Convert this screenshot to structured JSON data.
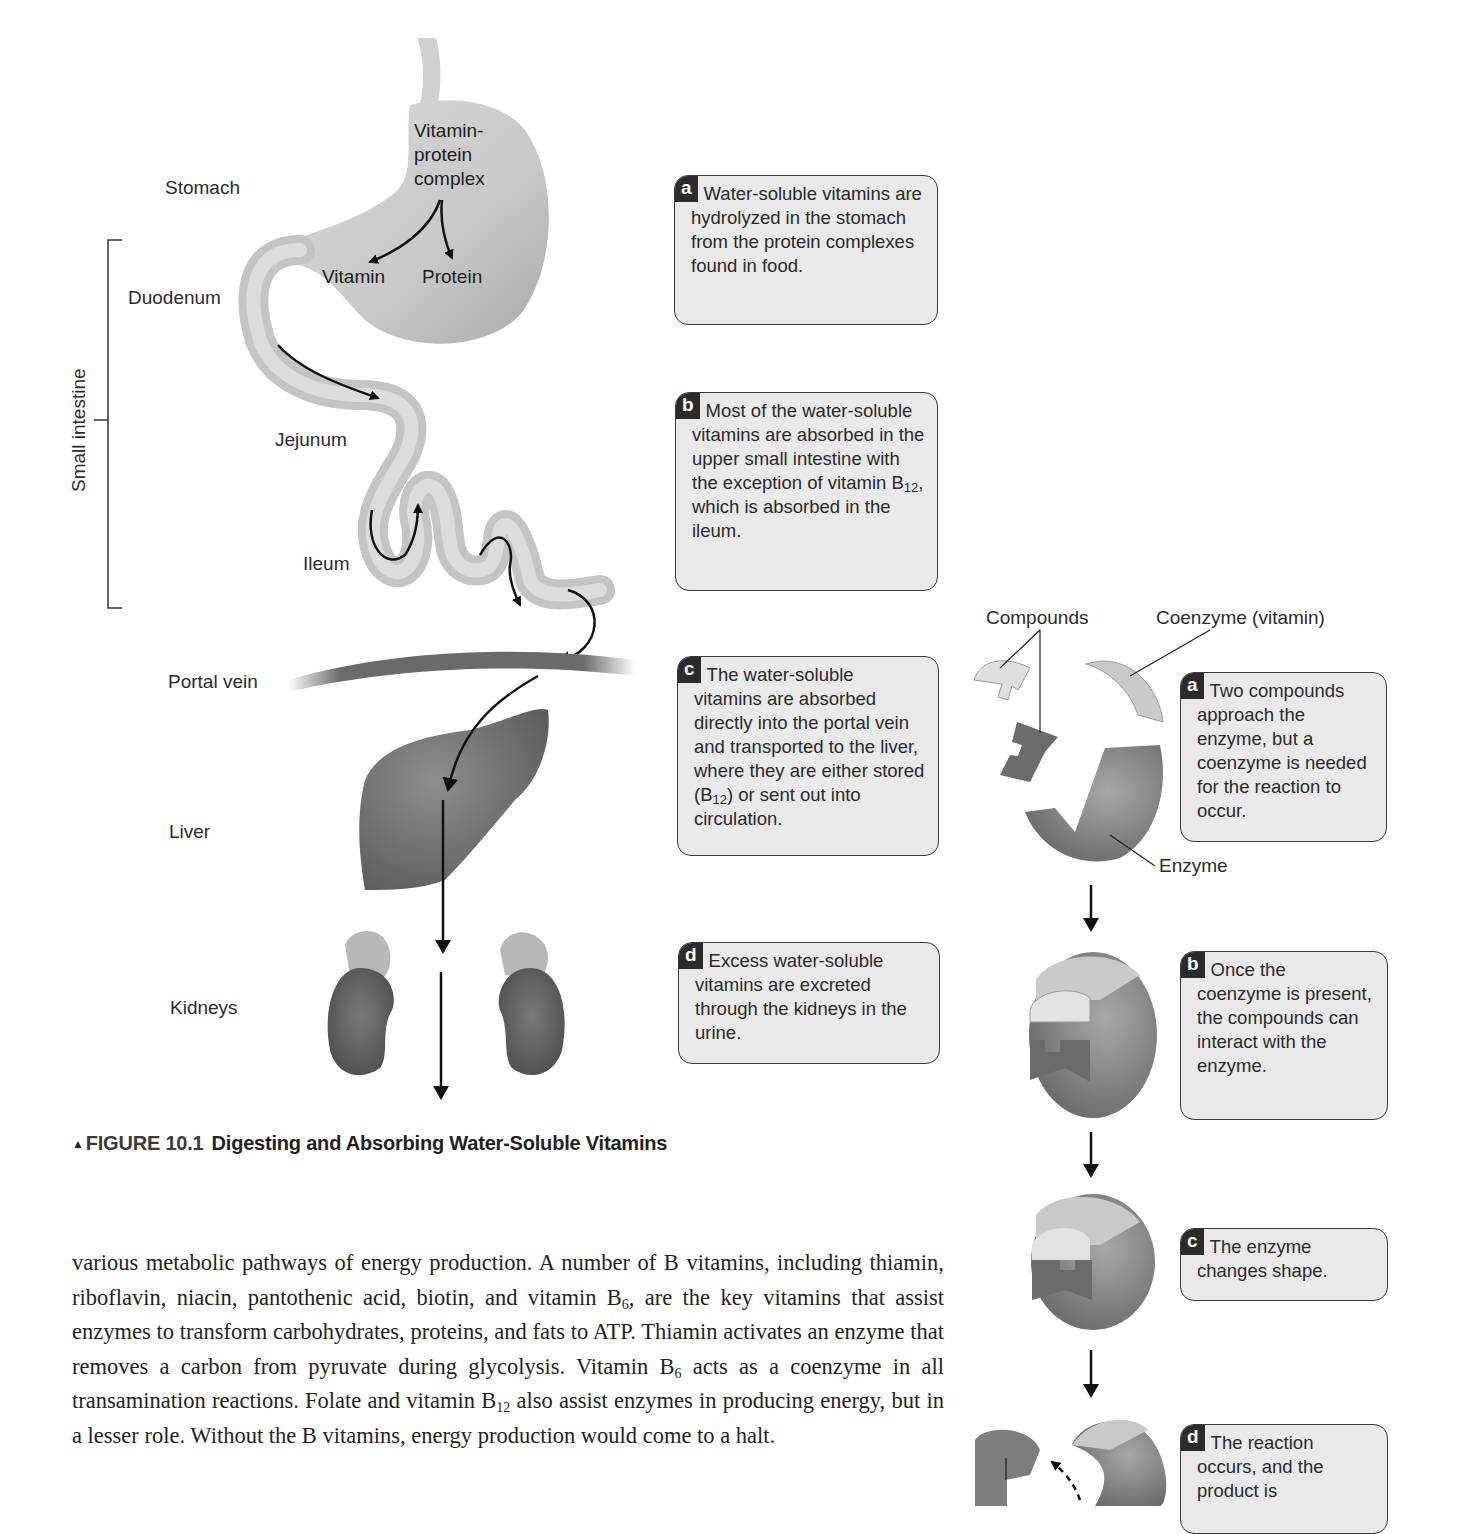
{
  "figure_left": {
    "organ_labels": {
      "stomach": "Stomach",
      "duodenum": "Duodenum",
      "small_intestine": "Small intestine",
      "jejunum": "Jejunum",
      "ileum": "Ileum",
      "portal_vein": "Portal vein",
      "liver": "Liver",
      "kidneys": "Kidneys"
    },
    "stomach_labels": {
      "complex_line1": "Vitamin-",
      "complex_line2": "protein",
      "complex_line3": "complex",
      "vitamin": "Vitamin",
      "protein": "Protein"
    },
    "callouts": [
      {
        "letter": "a",
        "text": "Water-soluble vitamins are hydrolyzed in the stomach from the protein complexes found in food."
      },
      {
        "letter": "b",
        "text_before": "Most of the water-soluble vitamins are absorbed in the upper small intestine with the exception of vitamin B",
        "sub": "12",
        "text_after": ", which is absorbed in the ileum."
      },
      {
        "letter": "c",
        "text_before": "The water-soluble vitamins are absorbed directly into the portal vein and transported to the liver, where they are either stored (B",
        "sub": "12",
        "text_after": ") or sent out into circulation."
      },
      {
        "letter": "d",
        "text": "Excess water-soluble vitamins are excreted through the kidneys in the urine."
      }
    ]
  },
  "figure_right": {
    "labels": {
      "compounds": "Compounds",
      "coenzyme": "Coenzyme (vitamin)",
      "enzyme": "Enzyme"
    },
    "callouts": [
      {
        "letter": "a",
        "text": "Two compounds approach the enzyme, but a coenzyme is needed for the reaction to occur."
      },
      {
        "letter": "b",
        "text": "Once the coenzyme is present, the compounds can interact with the enzyme."
      },
      {
        "letter": "c",
        "text": "The enzyme changes shape."
      },
      {
        "letter": "d",
        "text": "The reaction occurs, and the product is"
      }
    ]
  },
  "caption": {
    "marker": "▲",
    "figure_number": "FIGURE 10.1",
    "title": "Digesting and Absorbing Water-Soluble Vitamins"
  },
  "body": {
    "seg1": "various metabolic pathways of energy production. A number of B vitamins, including thiamin, riboflavin, niacin, pantothenic acid, biotin, and vitamin B",
    "sub1": "6",
    "seg2": ", are the key vitamins that assist enzymes to transform carbohydrates, proteins, and fats to ATP. Thiamin activates an enzyme that removes a carbon from pyruvate during glycolysis. Vitamin B",
    "sub2": "6",
    "seg3": " acts as a coenzyme in all transamination reactions. Folate and vitamin B",
    "sub3": "12",
    "seg4": " also assist enzymes in producing energy, but in a lesser role. Without the B vitamins, energy production would come to a halt."
  },
  "colors": {
    "callout_bg": "#e9e9e9",
    "badge_bg": "#2b2b2b",
    "organ_light": "#cfcfcf",
    "organ_dark": "#6e6e6e",
    "text": "#231f20"
  }
}
